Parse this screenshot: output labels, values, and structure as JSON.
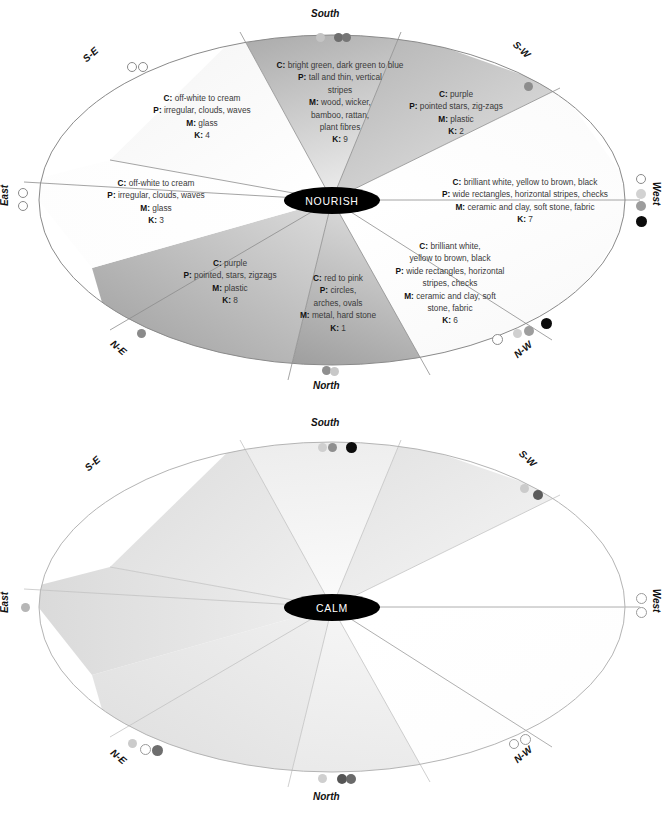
{
  "diagrams": [
    {
      "id": "nourish",
      "center_label": "NOURISH",
      "compass": [
        {
          "name": "South",
          "label": "South"
        },
        {
          "name": "S-W",
          "label": "S-W"
        },
        {
          "name": "West",
          "label": "West"
        },
        {
          "name": "N-W",
          "label": "N-W"
        },
        {
          "name": "North",
          "label": "North"
        },
        {
          "name": "N-E",
          "label": "N-E"
        },
        {
          "name": "East",
          "label": "East"
        },
        {
          "name": "S-E",
          "label": "S-E"
        }
      ],
      "sectors": [
        {
          "k": "9",
          "colour": "C: bright green, dark green to blue",
          "pattern": "P: tall and thin, vertical stripes",
          "material": "M: wood, wicker, bamboo, rattan, plant fibres",
          "lines": [
            "C: bright green, dark green to blue",
            "P: tall and thin, vertical",
            "stripes",
            "M: wood, wicker,",
            "bamboo, rattan,",
            "plant fibres",
            "K: 9"
          ]
        },
        {
          "k": "2",
          "colour": "C: purple",
          "pattern": "P: pointed stars, zig-zags",
          "material": "M: plastic",
          "lines": [
            "C: purple",
            "P: pointed stars, zig-zags",
            "M: plastic",
            "K: 2"
          ]
        },
        {
          "k": "7",
          "colour": "C: brilliant white, yellow to brown, black",
          "pattern": "P: wide rectangles, horizontal stripes, checks",
          "material": "M: ceramic and clay, soft stone, fabric",
          "lines": [
            "C: brilliant white, yellow to brown, black",
            "P: wide rectangles, horizontal stripes, checks",
            "M: ceramic and clay, soft stone, fabric",
            "K: 7"
          ]
        },
        {
          "k": "6",
          "colour": "C: brilliant white, yellow to brown, black",
          "pattern": "P: wide rectangles, horizontal stripes, checks",
          "material": "M: ceramic and clay, soft stone, fabric",
          "lines": [
            "C: brilliant white,",
            "yellow to brown, black",
            "P: wide rectangles, horizontal",
            "stripes, checks",
            "M: ceramic and clay, soft",
            "stone, fabric",
            "K: 6"
          ]
        },
        {
          "k": "1",
          "colour": "C: red to pink",
          "pattern": "P: circles, arches, ovals",
          "material": "M: metal, hard stone",
          "lines": [
            "C: red to pink",
            "P: circles,",
            "arches, ovals",
            "M: metal, hard stone",
            "K: 1"
          ]
        },
        {
          "k": "8",
          "colour": "C: purple",
          "pattern": "P: pointed, stars, zigzags",
          "material": "M: plastic",
          "lines": [
            "C: purple",
            "P: pointed, stars, zigzags",
            "M: plastic",
            "K: 8"
          ]
        },
        {
          "k": "3",
          "colour": "C: off-white to cream",
          "pattern": "P: irregular, clouds, waves",
          "material": "M: glass",
          "lines": [
            "C: off-white to cream",
            "P: irregular, clouds, waves",
            "M: glass",
            "K: 3"
          ]
        },
        {
          "k": "4",
          "colour": "C: off-white to cream",
          "pattern": "P: irregular, clouds, waves",
          "material": "M: glass",
          "lines": [
            "C: off-white to cream",
            "P: irregular, clouds, waves",
            "M: glass",
            "K: 4"
          ]
        }
      ]
    },
    {
      "id": "calm",
      "center_label": "CALM",
      "compass": [
        {
          "name": "South",
          "label": "South"
        },
        {
          "name": "S-W",
          "label": "S-W"
        },
        {
          "name": "West",
          "label": "West"
        },
        {
          "name": "N-W",
          "label": "N-W"
        },
        {
          "name": "North",
          "label": "North"
        },
        {
          "name": "N-E",
          "label": "N-E"
        },
        {
          "name": "East",
          "label": "East"
        },
        {
          "name": "S-E",
          "label": "S-E"
        }
      ],
      "sectors": [
        {
          "k": "9",
          "colour": "C: pale yellow to brown, matt black",
          "pattern": "P: wide rectangles, horizontal stripes, checks",
          "material": "M: ceramic and clay, soft stone, fabric",
          "lines": [
            "C: pale yellow to brown,",
            "matt black",
            "P: wide rectangles, horizontal",
            "stripes, checks",
            "M: ceramic and clay,",
            "soft stone,",
            "fabric",
            "K: 9"
          ]
        },
        {
          "k": "2",
          "colour": "C: pink, grey",
          "pattern": "P: circles, arches, ovals",
          "material": "M: metal, hard stone",
          "lines": [
            "C: pink, grey",
            "P: circles, arches, ovals",
            "M: metal, hard stone",
            "K: 2"
          ]
        },
        {
          "k": "7",
          "colour": "C: off-white to cream",
          "pattern": "P: irregular, clouds, waves",
          "material": "M: glass",
          "lines": [
            "C: off-white to cream",
            "P: irregular, clouds, waves",
            "M: glass",
            "K: 7"
          ]
        },
        {
          "k": "6",
          "colour": "C: off-white to cream",
          "pattern": "P: irregular clouds, waves",
          "material": "M: glass",
          "lines": [
            "C: off-white to cream",
            "P: irregular clouds, waves",
            "M: glass",
            "K: 6"
          ]
        },
        {
          "k": "1",
          "colour": "C: pale green, dark green to blue",
          "pattern": "P: tall and thin, vertical stripes",
          "material": "M: wood, wicker, bamboo, rattan, plant fibres",
          "lines": [
            "C: pale green,",
            "dark green to blue",
            "P: tall and thin,",
            "vertical stripes",
            "M: wood, wicker, bamboo,",
            "rattan, plant fibres",
            "K: 1"
          ]
        },
        {
          "k": "8",
          "colour": "C: pink, white to grey",
          "pattern": "P: circles, arches, ovals",
          "material": "M: metal, hard stone",
          "lines": [
            "C: pink, white to grey",
            "P: circles, arches, ovals",
            "M: metal, hard stone",
            "K: 8"
          ]
        },
        {
          "k": "3",
          "colour": "C: pale purple",
          "pattern": "P: pointed, stars, zig-zags",
          "material": "M: plastic",
          "lines": [
            "C: pale purple",
            "P: pointed, stars, zig-zags",
            "M: plastic",
            "K: 3"
          ]
        },
        {
          "k": "4",
          "colour": "C: pale purple",
          "pattern": "P: pointed, stars, zig-zags",
          "material": "M: plastic",
          "lines": [
            "C: pale purple",
            "P: pointed, stars, zig-zags",
            "M: plastic",
            "K: 4"
          ]
        }
      ]
    }
  ],
  "colors": {
    "center_fill": "#000000",
    "center_text": "#ffffff",
    "outline": "#8d8d8d",
    "text": "#3a3a3a",
    "dot_white": "#ffffff",
    "dot_light": "#cfcfcf",
    "dot_mid": "#a8a8a8",
    "dot_dark": "#6e6e6e",
    "dot_black": "#0c0c0c"
  }
}
